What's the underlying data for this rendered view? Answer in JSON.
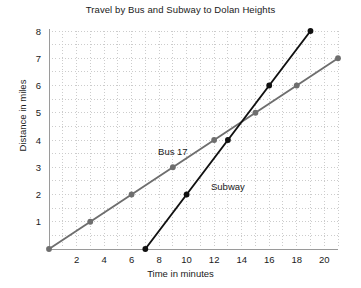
{
  "chart_data": {
    "type": "line",
    "title": "Travel by Bus and Subway to Dolan Heights",
    "xlabel": "Time in minutes",
    "ylabel": "Distance in miles",
    "xlim": [
      0,
      21
    ],
    "ylim": [
      0,
      8.35
    ],
    "xticks": [
      2,
      4,
      6,
      8,
      10,
      12,
      14,
      16,
      18,
      20
    ],
    "yticks": [
      1,
      2,
      3,
      4,
      5,
      6,
      7,
      8
    ],
    "grid": true,
    "grid_style": "dotted",
    "grid_color": "#cccccc",
    "legend": "inline-labels",
    "series": [
      {
        "name": "Bus 17",
        "color": "#6e6e6e",
        "marker": "circle",
        "label_x": 9,
        "label_y": 3.45,
        "points": [
          {
            "x": 0,
            "y": 0
          },
          {
            "x": 3,
            "y": 1
          },
          {
            "x": 6,
            "y": 2
          },
          {
            "x": 9,
            "y": 3
          },
          {
            "x": 12,
            "y": 4
          },
          {
            "x": 15,
            "y": 5
          },
          {
            "x": 18,
            "y": 6
          },
          {
            "x": 21,
            "y": 7
          }
        ]
      },
      {
        "name": "Subway",
        "color": "#111111",
        "marker": "circle",
        "label_x": 13.0,
        "label_y": 2.15,
        "points": [
          {
            "x": 7,
            "y": 0
          },
          {
            "x": 10,
            "y": 2
          },
          {
            "x": 13,
            "y": 4
          },
          {
            "x": 16,
            "y": 6
          },
          {
            "x": 19,
            "y": 8
          }
        ]
      }
    ]
  }
}
